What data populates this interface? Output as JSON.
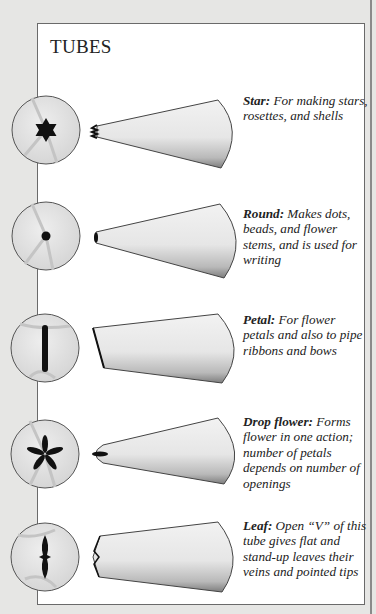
{
  "page": {
    "title": "TUBES",
    "colors": {
      "background": "#e6e6e4",
      "panel": "#ffffff",
      "ink": "#222222",
      "tube_fill": "#e9e9e9"
    }
  },
  "tubes": [
    {
      "name": "Star:",
      "description": " For making stars, rosettes, and shells",
      "tip_shape": "star-icon"
    },
    {
      "name": "Round:",
      "description": " Makes dots, beads, and flower stems, and is used for writing",
      "tip_shape": "dot-icon"
    },
    {
      "name": "Petal:",
      "description": " For flower petals and also to pipe ribbons and bows",
      "tip_shape": "petal-slit-icon"
    },
    {
      "name": "Drop flower:",
      "description": " Forms flower in one action; number of petals depends on number of openings",
      "tip_shape": "flower-icon"
    },
    {
      "name": "Leaf:",
      "description": " Open “V” of this tube gives flat and stand-up leaves their veins and pointed tips",
      "tip_shape": "leaf-icon"
    }
  ]
}
